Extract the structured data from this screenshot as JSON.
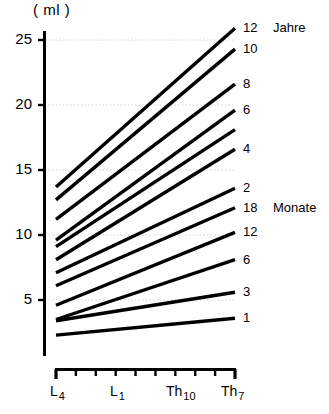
{
  "chart_data": {
    "type": "line",
    "title": "",
    "subtitle": "",
    "ylabel": "( ml )",
    "xlabel": "",
    "ylim": [
      0,
      26
    ],
    "yticks": [
      5,
      10,
      15,
      20,
      25
    ],
    "ytick_labels": [
      "5",
      "10",
      "15",
      "20",
      "25"
    ],
    "grid": true,
    "grid_style": "dotted",
    "legend_position": "right-inline",
    "x": [
      "L4",
      "Th7"
    ],
    "xtick_labels": [
      {
        "base": "L",
        "sub": "4"
      },
      {
        "base": "L",
        "sub": "1"
      },
      {
        "base": "Th",
        "sub": "10"
      },
      {
        "base": "Th",
        "sub": "7"
      }
    ],
    "x_tick_count": 10,
    "unit_groups": [
      {
        "name": "Jahre",
        "label": "Jahre"
      },
      {
        "name": "Monate",
        "label": "Monate"
      }
    ],
    "series": [
      {
        "name": "12 Jahre",
        "label": "12",
        "unit": "Jahre",
        "values": [
          13.7,
          25.9
        ]
      },
      {
        "name": "10 Jahre",
        "label": "10",
        "unit": "",
        "values": [
          12.7,
          24.3
        ]
      },
      {
        "name": "8 Jahre",
        "label": "8",
        "unit": "",
        "values": [
          11.2,
          21.6
        ]
      },
      {
        "name": "6 Jahre",
        "label": "6",
        "unit": "",
        "values": [
          9.6,
          19.6
        ]
      },
      {
        "name": "unlabeled",
        "label": "",
        "unit": "",
        "values": [
          9.1,
          18.1
        ]
      },
      {
        "name": "4 Jahre",
        "label": "4",
        "unit": "",
        "values": [
          8.1,
          16.6
        ]
      },
      {
        "name": "2 Jahre",
        "label": "2",
        "unit": "",
        "values": [
          7.1,
          13.6
        ]
      },
      {
        "name": "18 Monate",
        "label": "18",
        "unit": "Monate",
        "values": [
          6.1,
          12.1
        ]
      },
      {
        "name": "12 Monate",
        "label": "12",
        "unit": "",
        "values": [
          4.6,
          10.2
        ]
      },
      {
        "name": "6 Monate",
        "label": "6",
        "unit": "",
        "values": [
          3.5,
          8.1
        ]
      },
      {
        "name": "3 Monate",
        "label": "3",
        "unit": "",
        "values": [
          3.4,
          5.6
        ]
      },
      {
        "name": "1 Monat",
        "label": "1",
        "unit": "",
        "values": [
          2.3,
          3.6
        ]
      }
    ],
    "colors": {
      "line": "#000000",
      "axis": "#000000",
      "grid": "#cccccc",
      "background": "#ffffff"
    }
  }
}
